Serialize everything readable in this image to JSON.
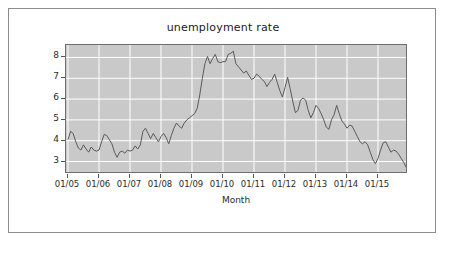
{
  "figure": {
    "title": "unemployment rate",
    "background": "#ffffff",
    "border_color": "#8c8c8c",
    "plot_background": "#c9c9c9",
    "gridline_color": "#ffffff",
    "line_color": "#5a5a5a"
  },
  "axis": {
    "x_title": "Month",
    "x_ticks": [
      "01/05",
      "01/06",
      "01/07",
      "01/08",
      "01/09",
      "01/10",
      "01/11",
      "01/12",
      "01/13",
      "01/14",
      "01/15"
    ],
    "y_ticks": [
      "3",
      "4",
      "5",
      "6",
      "7",
      "8"
    ]
  },
  "chart_data": {
    "type": "line",
    "title": "unemployment rate",
    "xlabel": "Month",
    "ylabel": "",
    "grid": true,
    "legend": "none",
    "xlim": [
      "01/05",
      "12/15"
    ],
    "ylim": [
      2.4,
      8.6
    ],
    "x_tick_labels": [
      "01/05",
      "01/06",
      "01/07",
      "01/08",
      "01/09",
      "01/10",
      "01/11",
      "01/12",
      "01/13",
      "01/14",
      "01/15"
    ],
    "y_tick_values": [
      3,
      4,
      5,
      6,
      7,
      8
    ],
    "series": [
      {
        "name": "unemployment rate",
        "color": "#5a5a5a",
        "x": [
          "01/05",
          "02/05",
          "03/05",
          "04/05",
          "05/05",
          "06/05",
          "07/05",
          "08/05",
          "09/05",
          "10/05",
          "11/05",
          "12/05",
          "01/06",
          "02/06",
          "03/06",
          "04/06",
          "05/06",
          "06/06",
          "07/06",
          "08/06",
          "09/06",
          "10/06",
          "11/06",
          "12/06",
          "01/07",
          "02/07",
          "03/07",
          "04/07",
          "05/07",
          "06/07",
          "07/07",
          "08/07",
          "09/07",
          "10/07",
          "11/07",
          "12/07",
          "01/08",
          "02/08",
          "03/08",
          "04/08",
          "05/08",
          "06/08",
          "07/08",
          "08/08",
          "09/08",
          "10/08",
          "11/08",
          "12/08",
          "01/09",
          "02/09",
          "03/09",
          "04/09",
          "05/09",
          "06/09",
          "07/09",
          "08/09",
          "09/09",
          "10/09",
          "11/09",
          "12/09",
          "01/10",
          "02/10",
          "03/10",
          "04/10",
          "05/10",
          "06/10",
          "07/10",
          "08/10",
          "09/10",
          "10/10",
          "11/10",
          "12/10",
          "01/11",
          "02/11",
          "03/11",
          "04/11",
          "05/11",
          "06/11",
          "07/11",
          "08/11",
          "09/11",
          "10/11",
          "11/11",
          "12/11",
          "01/12",
          "02/12",
          "03/12",
          "04/12",
          "05/12",
          "06/12",
          "07/12",
          "08/12",
          "09/12",
          "10/12",
          "11/12",
          "12/12",
          "01/13",
          "02/13",
          "03/13",
          "04/13",
          "05/13",
          "06/13",
          "07/13",
          "08/13",
          "09/13",
          "10/13",
          "11/13",
          "12/13",
          "01/14",
          "02/14",
          "03/14",
          "04/14",
          "05/14",
          "06/14",
          "07/14",
          "08/14",
          "09/14",
          "10/14",
          "11/14",
          "12/14",
          "01/15",
          "02/15",
          "03/15",
          "04/15",
          "05/15",
          "06/15",
          "07/15",
          "08/15",
          "09/15",
          "10/15",
          "11/15",
          "12/15"
        ],
        "values": [
          4.05,
          4.45,
          4.35,
          3.95,
          3.65,
          3.55,
          3.8,
          3.6,
          3.45,
          3.7,
          3.55,
          3.5,
          3.55,
          3.95,
          4.3,
          4.25,
          4.05,
          3.85,
          3.45,
          3.2,
          3.45,
          3.5,
          3.4,
          3.55,
          3.5,
          3.55,
          3.75,
          3.6,
          3.8,
          4.45,
          4.6,
          4.35,
          4.1,
          4.35,
          4.15,
          3.95,
          4.2,
          4.35,
          4.15,
          3.85,
          4.25,
          4.6,
          4.85,
          4.7,
          4.6,
          4.85,
          5.0,
          5.1,
          5.2,
          5.3,
          5.55,
          6.2,
          7.0,
          7.7,
          8.05,
          7.7,
          7.95,
          8.15,
          7.8,
          7.75,
          7.8,
          7.8,
          8.15,
          8.2,
          8.3,
          7.7,
          7.55,
          7.4,
          7.25,
          7.35,
          7.15,
          6.95,
          7.0,
          7.2,
          7.1,
          6.95,
          6.85,
          6.6,
          6.8,
          6.95,
          7.2,
          6.8,
          6.4,
          6.1,
          6.55,
          7.05,
          6.5,
          5.9,
          5.35,
          5.45,
          5.95,
          6.05,
          5.95,
          5.45,
          5.1,
          5.35,
          5.7,
          5.55,
          5.3,
          5.0,
          4.65,
          4.55,
          5.0,
          5.25,
          5.7,
          5.3,
          4.95,
          4.8,
          4.6,
          4.75,
          4.7,
          4.45,
          4.2,
          3.95,
          3.85,
          3.95,
          3.8,
          3.45,
          3.1,
          2.9,
          3.15,
          3.55,
          3.9,
          3.95,
          3.7,
          3.45,
          3.55,
          3.5,
          3.35,
          3.15,
          2.95,
          2.7
        ]
      }
    ]
  }
}
